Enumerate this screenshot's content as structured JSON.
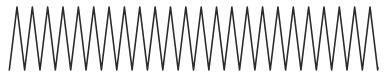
{
  "figure": {
    "title": "",
    "background_color": "#ffffff",
    "width": 386,
    "height": 76
  },
  "chart_data": {
    "type": "line",
    "title": "",
    "subtitle": "",
    "xlabel": "",
    "ylabel": "",
    "grid": false,
    "legend": null,
    "axes_visible": false,
    "tick_labels_x": [],
    "tick_labels_y": [],
    "xlim": [
      0,
      386
    ],
    "ylim": [
      7,
      70
    ],
    "series": [
      {
        "name": "waveform",
        "color": "#2b2b2b",
        "line_width": 1.6,
        "waveform": "triangle",
        "cycles": 24,
        "period_px": 15.35,
        "phase_start_px": 9.3,
        "peak_y_px": 7,
        "trough_y_px": 70,
        "amplitude_px": 31.5,
        "baseline_y_px": 38.5,
        "x_start_px": 9.3,
        "x_end_px": 378
      }
    ]
  }
}
